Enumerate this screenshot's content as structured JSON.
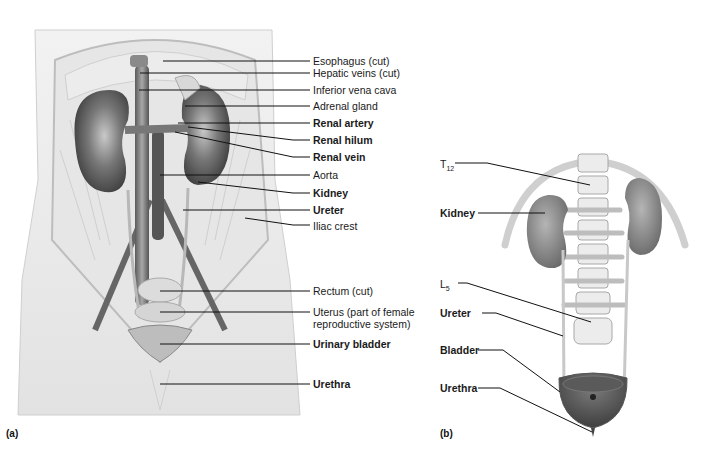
{
  "figure": {
    "panel_a": {
      "tag": "(a)",
      "labels": [
        {
          "text": "Esophagus (cut)",
          "bold": false
        },
        {
          "text": "Hepatic veins (cut)",
          "bold": false
        },
        {
          "text": "Inferior vena cava",
          "bold": false
        },
        {
          "text": "Adrenal gland",
          "bold": false
        },
        {
          "text": "Renal artery",
          "bold": true
        },
        {
          "text": "Renal hilum",
          "bold": true
        },
        {
          "text": "Renal vein",
          "bold": true
        },
        {
          "text": "Aorta",
          "bold": false
        },
        {
          "text": "Kidney",
          "bold": true
        },
        {
          "text": "Ureter",
          "bold": true
        },
        {
          "text": "Iliac crest",
          "bold": false
        },
        {
          "text": "Rectum (cut)",
          "bold": false
        },
        {
          "text": "Uterus (part of female",
          "bold": false
        },
        {
          "text": "reproductive system)",
          "bold": false
        },
        {
          "text": "Urinary bladder",
          "bold": true
        },
        {
          "text": "Urethra",
          "bold": true
        }
      ]
    },
    "panel_b": {
      "tag": "(b)",
      "labels": {
        "t12_main": "T",
        "t12_sub": "12",
        "kidney": "Kidney",
        "l5_main": "L",
        "l5_sub": "5",
        "ureter": "Ureter",
        "bladder": "Bladder",
        "urethra": "Urethra"
      }
    }
  }
}
